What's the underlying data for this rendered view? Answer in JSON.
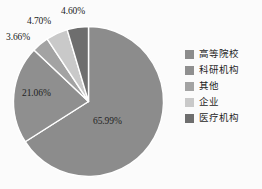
{
  "chart_data": {
    "type": "pie",
    "title": "",
    "subtitle": "",
    "xlabel": "",
    "ylabel": "",
    "grid": false,
    "legend_position": "right",
    "start_angle_deg": 0,
    "direction": "clockwise",
    "categories": [
      "高等院校",
      "科研机构",
      "其他",
      "企业",
      "医疗机构"
    ],
    "values": [
      65.99,
      21.06,
      3.66,
      4.7,
      4.6
    ],
    "labels": [
      "65.99%",
      "21.06%",
      "3.66%",
      "4.70%",
      "4.60%"
    ],
    "colors": [
      "#8c8c8c",
      "#8f8f8f",
      "#a3a3a3",
      "#c9c9c9",
      "#6e6e6e"
    ],
    "slice_border_color": "#ffffff",
    "background_color": "#fbfbfb",
    "slices": [
      {
        "name": "高等院校",
        "value": 65.99,
        "label": "65.99%",
        "color": "#8c8c8c"
      },
      {
        "name": "科研机构",
        "value": 21.06,
        "label": "21.06%",
        "color": "#8f8f8f"
      },
      {
        "name": "其他",
        "value": 3.66,
        "label": "3.66%",
        "color": "#a3a3a3"
      },
      {
        "name": "企业",
        "value": 4.7,
        "label": "4.70%",
        "color": "#c9c9c9"
      },
      {
        "name": "医疗机构",
        "value": 4.6,
        "label": "4.60%",
        "color": "#6e6e6e"
      }
    ]
  },
  "legend": {
    "items": [
      {
        "label": "高等院校",
        "color": "#8c8c8c"
      },
      {
        "label": "科研机构",
        "color": "#8f8f8f"
      },
      {
        "label": "其他",
        "color": "#a3a3a3"
      },
      {
        "label": "企业",
        "color": "#c9c9c9"
      },
      {
        "label": "医疗机构",
        "color": "#6e6e6e"
      }
    ]
  },
  "labels": {
    "l0": "65.99%",
    "l1": "21.06%",
    "l2": "3.66%",
    "l3": "4.70%",
    "l4": "4.60%"
  }
}
